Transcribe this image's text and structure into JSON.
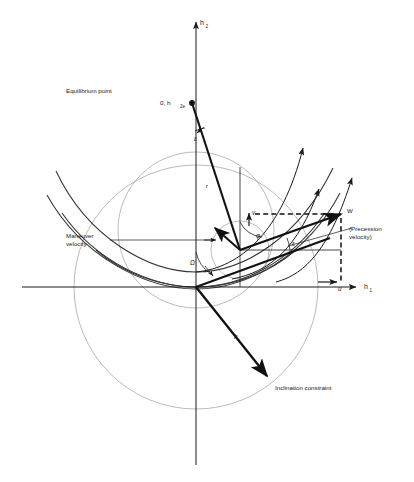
{
  "figure": {
    "name": "angular-momentum-maneuver-diagram",
    "type": "vector-diagram",
    "background_color": "#ffffff",
    "stroke_color": "#1a1a1a",
    "light_stroke_color": "#9a9a9a",
    "axes": {
      "x_label": "h",
      "x_subscript": "1",
      "y_label": "h",
      "y_subscript": "2",
      "origin": {
        "x": 196,
        "y": 287
      }
    },
    "labels": {
      "equilibrium_point": "Equilibrium point",
      "equilibrium_coords": "0, h",
      "equilibrium_coords_sub": "2e",
      "maneuver_velocity_line1": "Maneuver",
      "maneuver_velocity_line2": "velocity",
      "precession_velocity_line1": "(Precession",
      "precession_velocity_line2": "velocity)",
      "inclination_constraint": "Inclination constraint",
      "w_vector": "W",
      "u_component": "u",
      "v_component": "v",
      "gamma_component": "v",
      "r_vector": "r",
      "h_vector": "h",
      "h_vector_sub": "i",
      "angle_phi": "φ",
      "angle_epsilon": "ε",
      "angle_epsilon_top": "ε",
      "angle_omega": "Ω"
    },
    "elements": {
      "outer_circle": {
        "cx": 196,
        "cy": 287,
        "r": 122
      },
      "upper_circle": {
        "cx": 196,
        "cy": 230,
        "r": 78
      },
      "small_circle": {
        "cx": 240,
        "cy": 250,
        "r": 29
      },
      "node_point": {
        "x": 240,
        "y": 250
      },
      "equilibrium_marker": {
        "x": 192,
        "y": 103
      },
      "w_tip": {
        "x": 341,
        "y": 214
      },
      "inclination_tip": {
        "x": 267,
        "y": 376
      },
      "parabola_count": 3,
      "arrow_curve_count": 3
    }
  }
}
